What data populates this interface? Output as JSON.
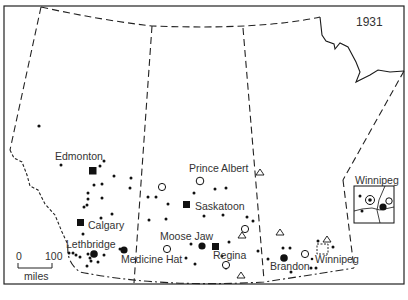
{
  "map": {
    "year": "1931",
    "colors": {
      "ink": "#1a1a1a",
      "background": "#ffffff",
      "text": "#333333"
    },
    "cities": [
      {
        "name": "Edmonton",
        "label_x": 61,
        "label_y": 161,
        "symbol": "square-filled",
        "x": 93,
        "y": 170
      },
      {
        "name": "Calgary",
        "label_x": 88,
        "label_y": 229,
        "symbol": "square-filled",
        "x": 81,
        "y": 223
      },
      {
        "name": "Lethbridge",
        "label_x": 66,
        "label_y": 249,
        "symbol": "circle-filled-large",
        "x": 94,
        "y": 254
      },
      {
        "name": "Medicine Hat",
        "label_x": 121,
        "label_y": 263,
        "symbol": "circle-filled-large",
        "x": 124,
        "y": 250
      },
      {
        "name": "Prince Albert",
        "label_x": 189,
        "label_y": 172,
        "symbol": "circle-open",
        "x": 200,
        "y": 181
      },
      {
        "name": "Saskatoon",
        "label_x": 195,
        "label_y": 210,
        "symbol": "square-filled",
        "x": 187,
        "y": 205
      },
      {
        "name": "Moose Jaw",
        "label_x": 160,
        "label_y": 240,
        "symbol": "circle-filled-large",
        "x": 202,
        "y": 246
      },
      {
        "name": "Regina",
        "label_x": 213,
        "label_y": 259,
        "symbol": "square-filled",
        "x": 216,
        "y": 246
      },
      {
        "name": "Brandon",
        "label_x": 270,
        "label_y": 270,
        "symbol": "circle-filled-large",
        "x": 284,
        "y": 258
      },
      {
        "name": "Winnipeg",
        "label_x": 316,
        "label_y": 264,
        "symbol": "square-dashed",
        "x": 322,
        "y": 248
      }
    ],
    "inset": {
      "title": "Winnipeg",
      "title_x": 356,
      "title_y": 185
    },
    "scale_bar": {
      "start_label": "0",
      "end_label": "100",
      "unit": "miles"
    },
    "legend_symbols": [
      "small-dot",
      "circle-filled-large",
      "circle-open",
      "square-filled",
      "triangle-open",
      "square-dashed"
    ]
  }
}
